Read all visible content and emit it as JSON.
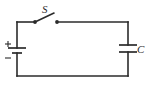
{
  "figure": {
    "background_color": "#ffffff",
    "line_color": "#2b2b2b",
    "width": 150,
    "height": 90
  },
  "labels": {
    "switch": "S",
    "capacitor": "C",
    "battery_positive": "+",
    "battery_negative": "−"
  },
  "components": {
    "battery": {
      "name": "battery",
      "side": "left",
      "positive_terminal": "top",
      "negative_terminal": "bottom"
    },
    "switch": {
      "name": "switch",
      "side": "top",
      "state": "open"
    },
    "capacitor": {
      "name": "capacitor",
      "side": "right"
    }
  },
  "geometry": {
    "loop": {
      "left_x": 17,
      "right_x": 128,
      "top_y": 22,
      "bottom_y": 76
    },
    "switch": {
      "left_contact_x": 35,
      "right_contact_x": 57,
      "contact_y": 22,
      "blade_tip_x": 54,
      "blade_tip_y": 13
    },
    "battery": {
      "center_x": 17,
      "long_plate_y": 48,
      "short_plate_y": 53,
      "long_plate_half_width": 9,
      "short_plate_half_width": 5
    },
    "capacitor": {
      "center_x": 128,
      "top_plate_y": 45,
      "bottom_plate_y": 52,
      "plate_half_width": 9
    }
  }
}
